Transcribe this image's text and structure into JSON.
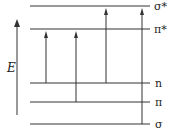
{
  "diagram": {
    "axis_label": "E",
    "levels": [
      {
        "id": "sigma-star",
        "label": "σ*",
        "y": 6
      },
      {
        "id": "pi-star",
        "label": "π*",
        "y": 29
      },
      {
        "id": "n",
        "label": "n",
        "y": 83
      },
      {
        "id": "pi",
        "label": "π",
        "y": 102
      },
      {
        "id": "sigma",
        "label": "σ",
        "y": 124
      }
    ],
    "transitions": [
      {
        "from": "n",
        "to": "π*",
        "x": 46
      },
      {
        "from": "π",
        "to": "π*",
        "x": 76
      },
      {
        "from": "n",
        "to": "σ*",
        "x": 106
      },
      {
        "from": "σ",
        "to": "σ*",
        "x": 142
      }
    ],
    "colors": {
      "line": "#333333",
      "text": "#222222"
    }
  }
}
